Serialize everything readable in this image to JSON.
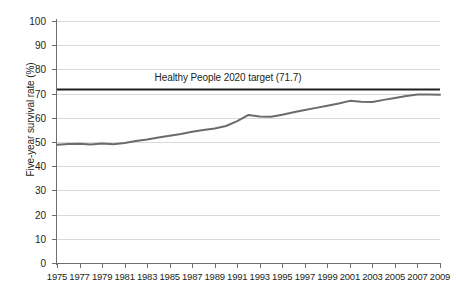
{
  "chart_data": {
    "type": "line",
    "title": "",
    "xlabel": "",
    "ylabel": "Five-year survival rate (%)",
    "ylim": [
      0,
      100
    ],
    "xlim": [
      1975,
      2009
    ],
    "ytick_step": 10,
    "xtick_step": 2,
    "grid": true,
    "legend": "none",
    "yticks": [
      "0",
      "10",
      "20",
      "30",
      "40",
      "50",
      "60",
      "70",
      "80",
      "90",
      "100"
    ],
    "xticks": [
      "1975",
      "1977",
      "1979",
      "1981",
      "1983",
      "1985",
      "1987",
      "1989",
      "1991",
      "1993",
      "1995",
      "1997",
      "1999",
      "2001",
      "2003",
      "2005",
      "2007",
      "2009"
    ],
    "series": [
      {
        "name": "Five-year survival rate",
        "color": "#6b6b6b",
        "x": [
          1975,
          1976,
          1977,
          1978,
          1979,
          1980,
          1981,
          1982,
          1983,
          1984,
          1985,
          1986,
          1987,
          1988,
          1989,
          1990,
          1991,
          1992,
          1993,
          1994,
          1995,
          1996,
          1997,
          1998,
          1999,
          2000,
          2001,
          2002,
          2003,
          2004,
          2005,
          2006,
          2007,
          2008,
          2009
        ],
        "values": [
          48.9,
          49.2,
          49.3,
          49.0,
          49.4,
          49.1,
          49.6,
          50.4,
          51.0,
          51.9,
          52.6,
          53.3,
          54.2,
          55.0,
          55.6,
          56.6,
          58.6,
          61.2,
          60.5,
          60.4,
          61.3,
          62.3,
          63.2,
          64.1,
          65.0,
          65.9,
          67.0,
          66.6,
          66.5,
          67.4,
          68.2,
          69.0,
          69.6,
          69.6,
          69.5
        ]
      }
    ],
    "annotations": [
      {
        "name": "healthy-people-2020-target",
        "label": "Healthy People 2020 target (71.7)",
        "value": 71.7,
        "color": "#231f20",
        "style": "horizontal-reference-line"
      }
    ]
  },
  "axis": {
    "y_title": "Five-year survival rate (%)"
  }
}
